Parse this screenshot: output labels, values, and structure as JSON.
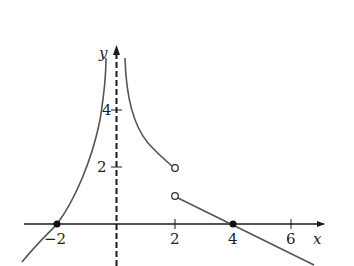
{
  "figure": {
    "type": "function-graph",
    "axes": {
      "x_label": "x",
      "y_label": "y",
      "x_ticks": [
        {
          "value": -2,
          "label": "−2"
        },
        {
          "value": 2,
          "label": "2"
        },
        {
          "value": 4,
          "label": "4"
        },
        {
          "value": 6,
          "label": "6"
        }
      ],
      "y_ticks": [
        {
          "value": 2,
          "label": "2"
        },
        {
          "value": 4,
          "label": "4"
        }
      ]
    },
    "asymptote": {
      "type": "vertical",
      "x": 0,
      "style": "dashed"
    },
    "pieces": [
      {
        "name": "left-branch",
        "domain": "x < 0",
        "description": "increasing curve through (-2,0) rising to +infinity as x approaches 0 from the left"
      },
      {
        "name": "middle-branch",
        "domain": "0 < x < 2",
        "description": "decreasing curve from +infinity down to open point at (2,2)"
      },
      {
        "name": "right-line",
        "domain": "x > 2",
        "description": "line from open point (2,1) through (4,0) decreasing"
      }
    ],
    "points": [
      {
        "x": -2,
        "y": 0,
        "style": "closed"
      },
      {
        "x": 4,
        "y": 0,
        "style": "closed"
      },
      {
        "x": 2,
        "y": 2,
        "style": "open"
      },
      {
        "x": 2,
        "y": 1,
        "style": "open"
      }
    ],
    "colors": {
      "axis": "#1a1a1a",
      "curve": "#555555"
    }
  }
}
